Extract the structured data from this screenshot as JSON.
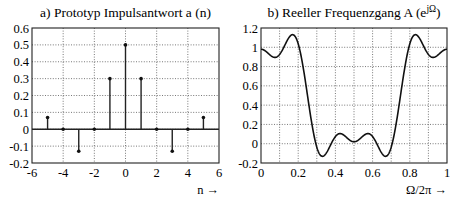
{
  "chart_data": [
    {
      "type": "stem",
      "title": "a) Prototyp Impulsantwort a (n)",
      "xlabel": "n →",
      "ylabel": "",
      "xlim": [
        -6,
        6
      ],
      "ylim": [
        -0.2,
        0.6
      ],
      "xticks": [
        "-6",
        "-4",
        "-2",
        "0",
        "2",
        "4",
        "6"
      ],
      "yticks": [
        "0.6",
        "0.5",
        "0.4",
        "0.3",
        "0.2",
        "0.1",
        "0",
        "-0.1",
        "-0.2"
      ],
      "grid": true,
      "x": [
        -5,
        -4,
        -3,
        -2,
        -1,
        0,
        1,
        2,
        3,
        4,
        5
      ],
      "values": [
        0.07,
        0,
        -0.13,
        0,
        0.3,
        0.5,
        0.3,
        0,
        -0.13,
        0,
        0.07
      ]
    },
    {
      "type": "line",
      "title": "b) Reeller Frequenzgang A (e",
      "title_superscript": "jΩ",
      "title_close": ")",
      "xlabel": "Ω/2π →",
      "ylabel": "",
      "xlim": [
        0,
        1
      ],
      "ylim": [
        -0.2,
        1.2
      ],
      "xticks": [
        "0",
        "0.2",
        "0.4",
        "0.6",
        "0.8",
        "1"
      ],
      "yticks": [
        "1.2",
        "1",
        "0.8",
        "0.6",
        "0.4",
        "0.2",
        "0",
        "-0.2"
      ],
      "grid": true,
      "x": [
        0,
        0.05,
        0.1,
        0.15,
        0.2,
        0.25,
        0.3,
        0.35,
        0.4,
        0.45,
        0.5,
        0.55,
        0.6,
        0.65,
        0.7,
        0.75,
        0.8,
        0.85,
        0.9,
        0.95,
        1
      ],
      "values": [
        0.98,
        0.92,
        0.93,
        1.1,
        1.04,
        0.5,
        -0.04,
        -0.1,
        0.08,
        0.08,
        0.02,
        0.08,
        0.08,
        -0.1,
        -0.04,
        0.5,
        1.04,
        1.1,
        0.93,
        0.92,
        0.98
      ]
    }
  ]
}
